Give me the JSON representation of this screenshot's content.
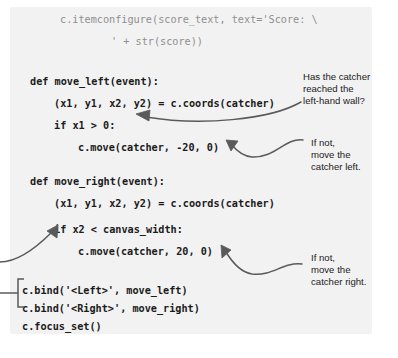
{
  "figure": {
    "kind": "annotated-code-listing",
    "language": "python",
    "panel_color": "#f2f2f2",
    "background_color": "#ffffff",
    "code_color": "#1b1b1b",
    "faded_code_color": "#8f8f8f",
    "annotation_color": "#1b1b1b",
    "arrow_color": "#5a5a5a"
  },
  "code": {
    "lines": [
      {
        "text": "c.itemconfigure(score_text, text='Score: \\",
        "x": 60,
        "y": 14,
        "faded": true
      },
      {
        "text": "' + str(score))",
        "x": 111,
        "y": 36,
        "faded": true
      },
      {
        "text": "def move_left(event):",
        "x": 30,
        "y": 76,
        "faded": false
      },
      {
        "text": "(x1, y1, x2, y2) = c.coords(catcher)",
        "x": 54,
        "y": 98,
        "faded": false
      },
      {
        "text": "if x1 > 0:",
        "x": 54,
        "y": 120,
        "faded": false
      },
      {
        "text": "c.move(catcher, -20, 0)",
        "x": 78,
        "y": 142,
        "faded": false
      },
      {
        "text": "def move_right(event):",
        "x": 30,
        "y": 176,
        "faded": false
      },
      {
        "text": "(x1, y1, x2, y2) = c.coords(catcher)",
        "x": 54,
        "y": 198,
        "faded": false
      },
      {
        "text": "if x2 < canvas_width:",
        "x": 54,
        "y": 224,
        "faded": false
      },
      {
        "text": "c.move(catcher, 20, 0)",
        "x": 78,
        "y": 246,
        "faded": false
      },
      {
        "text": "c.bind('<Left>', move_left)",
        "x": 22,
        "y": 285,
        "faded": false
      },
      {
        "text": "c.bind('<Right>', move_right)",
        "x": 22,
        "y": 303,
        "faded": false
      },
      {
        "text": "c.focus_set()",
        "x": 22,
        "y": 321,
        "faded": false
      }
    ]
  },
  "annotations": [
    {
      "name": "annotation-left-wall-check",
      "text": "Has the catcher\nreached the\nleft-hand wall?",
      "x": 303,
      "y": 71
    },
    {
      "name": "annotation-move-catcher-left",
      "text": "If not,\nmove the\ncatcher left.",
      "x": 311,
      "y": 137
    },
    {
      "name": "annotation-move-catcher-right",
      "text": "If not,\nmove the\ncatcher right.",
      "x": 311,
      "y": 252
    }
  ],
  "arrows": [
    {
      "name": "arrow-to-if-x1-gt-0",
      "path": "M 301 102 C 270 120, 200 126, 146 117",
      "head": "M 136 114 L 150 110 L 149 121 Z"
    },
    {
      "name": "arrow-to-move-catcher-left",
      "path": "M 303 140 C 284 138, 276 158, 252 157 C 243 156, 236 150, 232 145",
      "head": "M 226 140 L 238 141 L 231 151 Z"
    },
    {
      "name": "arrow-to-if-x2-lt-canvas-width",
      "path": "M 0 262 C 18 262, 36 248, 52 232",
      "head": "M 58 225 L 57 238 L 47 231 Z"
    },
    {
      "name": "arrow-to-move-catcher-right",
      "path": "M 302 264 C 282 262, 274 276, 252 274 C 240 272, 232 262, 226 252",
      "head": "M 221 245 L 222 258 L 231 250 Z"
    }
  ],
  "bracket": {
    "name": "bracket-key-bindings",
    "path": "M 24 279 L 18 279 L 18 307 L 24 307",
    "stem": "M 0 293 L 18 293"
  }
}
